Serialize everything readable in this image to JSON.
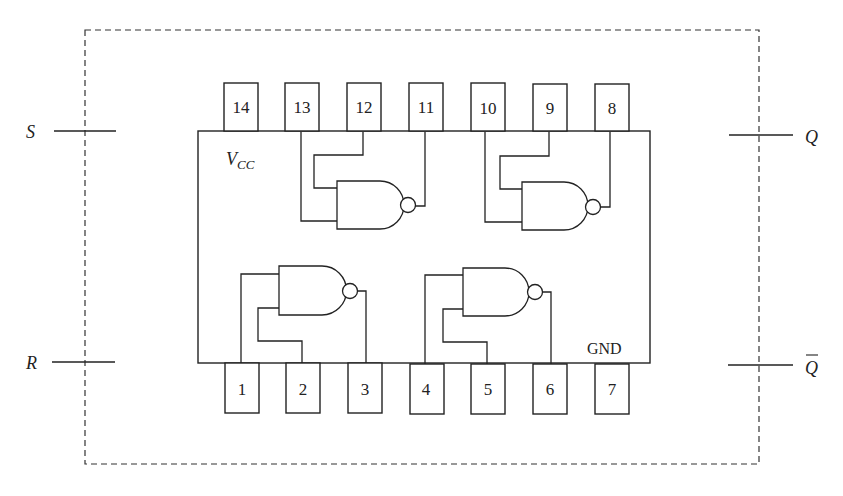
{
  "diagram": {
    "signals": {
      "s": "S",
      "r": "R",
      "q": "Q",
      "q_bar": "Q"
    },
    "chip": {
      "vcc_label_main": "V",
      "vcc_label_sub": "CC",
      "gnd_label": "GND"
    },
    "top_pins": [
      "14",
      "13",
      "12",
      "11",
      "10",
      "9",
      "8"
    ],
    "bottom_pins": [
      "1",
      "2",
      "3",
      "4",
      "5",
      "6",
      "7"
    ],
    "gates": [
      {
        "name": "gate-1",
        "inputs": [
          "1",
          "2"
        ],
        "output": "3"
      },
      {
        "name": "gate-2",
        "inputs": [
          "4",
          "5"
        ],
        "output": "6"
      },
      {
        "name": "gate-3",
        "inputs": [
          "13",
          "12"
        ],
        "output": "11"
      },
      {
        "name": "gate-4",
        "inputs": [
          "10",
          "9"
        ],
        "output": "8"
      }
    ],
    "colors": {
      "line": "#222222",
      "background": "#ffffff"
    }
  }
}
